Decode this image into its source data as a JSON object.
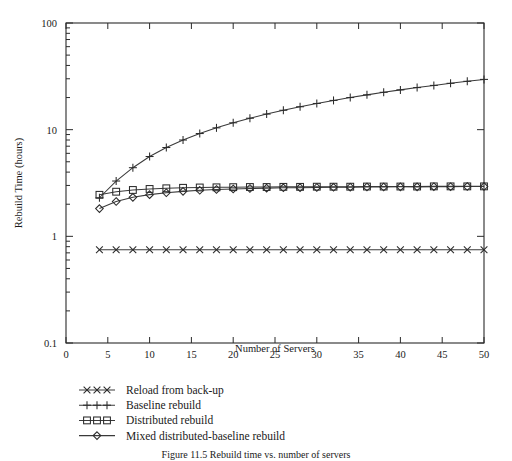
{
  "chart_data": {
    "type": "line",
    "title": "",
    "xlabel": "Number of Servers",
    "ylabel": "Rebuild Time (hours)",
    "xlim": [
      0,
      50
    ],
    "ylim": [
      0.1,
      100
    ],
    "yscale": "log",
    "xscale": "linear",
    "grid": false,
    "legend_position": "below-plot-left",
    "xticks": [
      0,
      5,
      10,
      15,
      20,
      25,
      30,
      35,
      40,
      45,
      50
    ],
    "xticklabels": [
      "0",
      "5",
      "10",
      "15",
      "20",
      "25",
      "30",
      "35",
      "40",
      "45",
      "50"
    ],
    "yticks": [
      0.1,
      1,
      10,
      100
    ],
    "yticklabels": [
      "0.1",
      "1",
      "10",
      "100"
    ],
    "x": [
      4,
      6,
      8,
      10,
      12,
      14,
      16,
      18,
      20,
      22,
      24,
      26,
      28,
      30,
      32,
      34,
      36,
      38,
      40,
      42,
      44,
      46,
      48,
      50
    ],
    "series": [
      {
        "name": "Reload from back-up",
        "marker": "x",
        "values": [
          0.75,
          0.75,
          0.75,
          0.75,
          0.75,
          0.75,
          0.75,
          0.75,
          0.75,
          0.75,
          0.75,
          0.75,
          0.75,
          0.75,
          0.75,
          0.75,
          0.75,
          0.75,
          0.75,
          0.75,
          0.75,
          0.75,
          0.75,
          0.75
        ]
      },
      {
        "name": "Baseline rebuild",
        "marker": "plus",
        "values": [
          2.3,
          3.3,
          4.4,
          5.6,
          6.8,
          8.0,
          9.2,
          10.4,
          11.6,
          12.8,
          14.0,
          15.2,
          16.4,
          17.6,
          18.8,
          20.0,
          21.2,
          22.4,
          23.6,
          24.8,
          26.0,
          27.2,
          28.4,
          29.6
        ]
      },
      {
        "name": "Distributed rebuild",
        "marker": "square",
        "values": [
          2.45,
          2.62,
          2.72,
          2.78,
          2.82,
          2.85,
          2.87,
          2.88,
          2.89,
          2.9,
          2.9,
          2.91,
          2.91,
          2.92,
          2.92,
          2.92,
          2.93,
          2.93,
          2.93,
          2.93,
          2.94,
          2.94,
          2.94,
          2.94
        ]
      },
      {
        "name": "Mixed distributed-baseline rebuild",
        "marker": "diamond",
        "values": [
          1.82,
          2.12,
          2.32,
          2.46,
          2.56,
          2.64,
          2.7,
          2.75,
          2.78,
          2.81,
          2.83,
          2.85,
          2.86,
          2.87,
          2.88,
          2.89,
          2.9,
          2.9,
          2.91,
          2.91,
          2.92,
          2.92,
          2.93,
          2.93
        ]
      }
    ]
  },
  "legend": {
    "items": [
      {
        "label": "Reload from back-up",
        "marker": "x"
      },
      {
        "label": "Baseline rebuild",
        "marker": "plus"
      },
      {
        "label": "Distributed rebuild",
        "marker": "square"
      },
      {
        "label": "Mixed distributed-baseline rebuild",
        "marker": "diamond"
      }
    ]
  },
  "caption": {
    "text": "Figure 11.5  Rebuild time vs. number of servers"
  }
}
